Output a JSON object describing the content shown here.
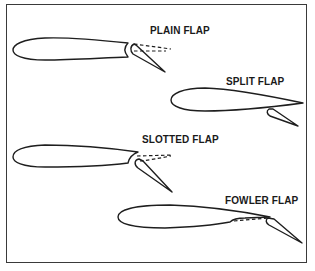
{
  "figure": {
    "panels": [
      {
        "id": "plain",
        "label": "PLAIN FLAP"
      },
      {
        "id": "split",
        "label": "SPLIT FLAP"
      },
      {
        "id": "slotted",
        "label": "SLOTTED FLAP"
      },
      {
        "id": "fowler",
        "label": "FOWLER FLAP"
      }
    ],
    "colors": {
      "stroke": "#1e1e1e",
      "background": "#ffffff",
      "frame": "#3a3a3a"
    }
  }
}
